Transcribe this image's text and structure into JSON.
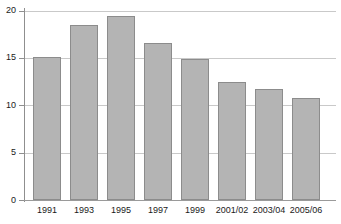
{
  "chart_data": {
    "type": "bar",
    "title": "",
    "subtitle": "",
    "xlabel": "",
    "ylabel": "",
    "categories": [
      "1991",
      "1993",
      "1995",
      "1997",
      "1999",
      "2001/02",
      "2003/04",
      "2005/06"
    ],
    "values": [
      15.1,
      18.5,
      19.4,
      16.6,
      14.9,
      12.5,
      11.7,
      10.8
    ],
    "series": [
      {
        "name": "",
        "values": [
          15.1,
          18.5,
          19.4,
          16.6,
          14.9,
          12.5,
          11.7,
          10.8
        ]
      }
    ],
    "ylim": [
      0,
      20
    ],
    "yticks": [
      0,
      5,
      10,
      15,
      20
    ],
    "ytick_labels": [
      "0",
      "5",
      "10",
      "15",
      "20"
    ],
    "xtick_labels": [
      "1991",
      "1993",
      "1995",
      "1997",
      "1999",
      "2001/02",
      "2003/04",
      "2005/06"
    ],
    "grid": "horizontal",
    "gridlines_at": [
      5,
      10,
      15,
      20
    ],
    "legend": "none",
    "legend_entries": [],
    "annotations": [],
    "colors": {
      "bar_fill": "#b4b4b4",
      "bar_edge": "#8c8c8c",
      "gridline": "#c9c9c9",
      "axis": "#8f8f8f",
      "text": "#1a1a1a",
      "background": "#ffffff"
    }
  }
}
